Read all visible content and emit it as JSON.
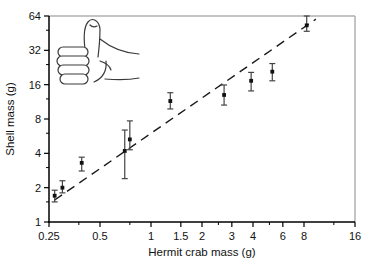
{
  "figure": {
    "xlabel": "Hermit crab mass (g)",
    "ylabel": "Shell mass (g)"
  },
  "decorations": {
    "thumbs_up_icon": "thumbs-up"
  },
  "chart_data": {
    "type": "scatter",
    "title": "",
    "xlabel": "Hermit crab mass (g)",
    "ylabel": "Shell mass (g)",
    "x_scale": "log",
    "y_scale": "log",
    "xlim": [
      0.25,
      16
    ],
    "ylim": [
      1,
      64
    ],
    "grid": false,
    "legend": "none",
    "x_ticks": [
      {
        "value": 0.25,
        "label": "0.25"
      },
      {
        "value": 0.5,
        "label": "0.5"
      },
      {
        "value": 1,
        "label": "1"
      },
      {
        "value": 1.5,
        "label": "1.5"
      },
      {
        "value": 2,
        "label": "2"
      },
      {
        "value": 3,
        "label": "3"
      },
      {
        "value": 4,
        "label": "4"
      },
      {
        "value": 6,
        "label": "6"
      },
      {
        "value": 8,
        "label": "8"
      },
      {
        "value": 16,
        "label": "16"
      }
    ],
    "x_minor_ticks": [
      0.375,
      0.75,
      2.5,
      5,
      12
    ],
    "y_ticks": [
      {
        "value": 1,
        "label": "1"
      },
      {
        "value": 2,
        "label": "2"
      },
      {
        "value": 4,
        "label": "4"
      },
      {
        "value": 8,
        "label": "8"
      },
      {
        "value": 16,
        "label": "16"
      },
      {
        "value": 32,
        "label": "32"
      },
      {
        "value": 64,
        "label": "64"
      }
    ],
    "y_minor_ticks": [
      1.5,
      3,
      6,
      12,
      24,
      48
    ],
    "series": [
      {
        "name": "shell mass vs crab mass (mean ± error)",
        "marker": "square",
        "points": [
          {
            "x": 0.27,
            "y": 1.7,
            "err_lo": 1.5,
            "err_hi": 1.9
          },
          {
            "x": 0.3,
            "y": 2.0,
            "err_lo": 1.8,
            "err_hi": 2.3
          },
          {
            "x": 0.39,
            "y": 3.3,
            "err_lo": 2.8,
            "err_hi": 3.7
          },
          {
            "x": 0.7,
            "y": 4.2,
            "err_lo": 2.4,
            "err_hi": 6.4
          },
          {
            "x": 0.75,
            "y": 5.3,
            "err_lo": 4.3,
            "err_hi": 7.7
          },
          {
            "x": 1.3,
            "y": 11.5,
            "err_lo": 9.8,
            "err_hi": 13.6
          },
          {
            "x": 2.7,
            "y": 13.0,
            "err_lo": 10.6,
            "err_hi": 15.9
          },
          {
            "x": 3.9,
            "y": 17.3,
            "err_lo": 14.1,
            "err_hi": 20.5
          },
          {
            "x": 5.2,
            "y": 20.8,
            "err_lo": 17.3,
            "err_hi": 24.5
          },
          {
            "x": 8.3,
            "y": 53.0,
            "err_lo": 47.0,
            "err_hi": 64.0
          }
        ]
      }
    ],
    "trend_line": {
      "style": "dashed",
      "x1": 0.27,
      "y1": 1.56,
      "x2": 9.4,
      "y2": 60.0
    },
    "colors": {
      "axis": "#000000",
      "frame": "#b0b0b0",
      "marker": "#111111",
      "error_bar": "#444444",
      "trend": "#1a1a1a",
      "background": "#ffffff"
    }
  }
}
